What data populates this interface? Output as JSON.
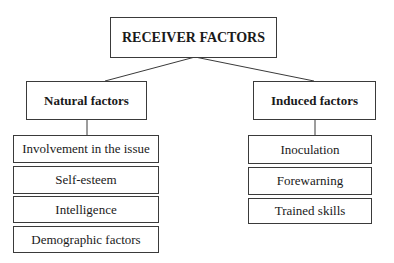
{
  "diagram": {
    "root": {
      "label": "RECEIVER FACTORS"
    },
    "branches": [
      {
        "label": "Natural factors",
        "items": [
          "Involvement in the issue",
          "Self-esteem",
          "Intelligence",
          "Demographic factors"
        ]
      },
      {
        "label": "Induced factors",
        "items": [
          "Inoculation",
          "Forewarning",
          "Trained skills"
        ]
      }
    ],
    "colors": {
      "line": "#3a3a3a",
      "text": "#1a1a1a",
      "background": "#ffffff"
    }
  }
}
